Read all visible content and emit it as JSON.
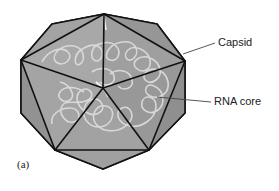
{
  "diagram": {
    "panel_label": "(a)",
    "labels": {
      "capsid": "Capsid",
      "rna_core": "RNA core"
    },
    "colors": {
      "face_light": "#a6a6a6",
      "face_mid": "#9a9a9a",
      "face_dark": "#8e8e8e",
      "edge": "#111111",
      "rna_strand": "#d8d8d8",
      "leader_line": "#444444",
      "text": "#222222"
    }
  }
}
